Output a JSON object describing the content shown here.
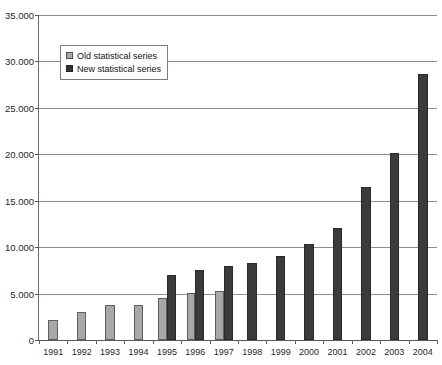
{
  "chart_data": {
    "type": "bar",
    "title": "",
    "xlabel": "",
    "ylabel": "",
    "ylim": [
      0,
      35000
    ],
    "ytick_labels": [
      "0",
      "5.000",
      "10.000",
      "15.000",
      "20.000",
      "25.000",
      "30.000",
      "35.000"
    ],
    "ytick_values": [
      0,
      5000,
      10000,
      15000,
      20000,
      25000,
      30000,
      35000
    ],
    "grid": true,
    "legend_position": "upper left",
    "categories": [
      "1991",
      "1992",
      "1993",
      "1994",
      "1995",
      "1996",
      "1997",
      "1998",
      "1999",
      "2000",
      "2001",
      "2002",
      "2003",
      "2004"
    ],
    "series": [
      {
        "name": "Old statistical series",
        "color": "#a8a8a8",
        "values": [
          2200,
          3000,
          3800,
          3800,
          4500,
          5100,
          5300,
          null,
          null,
          null,
          null,
          null,
          null,
          null
        ]
      },
      {
        "name": "New statistical series",
        "color": "#3b3b3b",
        "values": [
          null,
          null,
          null,
          null,
          7000,
          7500,
          8000,
          8300,
          9100,
          10300,
          12100,
          16500,
          20100,
          28700
        ]
      }
    ]
  },
  "legend": {
    "items": [
      {
        "label": "Old statistical series",
        "swatch": "old"
      },
      {
        "label": "New statistical series",
        "swatch": "new"
      }
    ]
  }
}
